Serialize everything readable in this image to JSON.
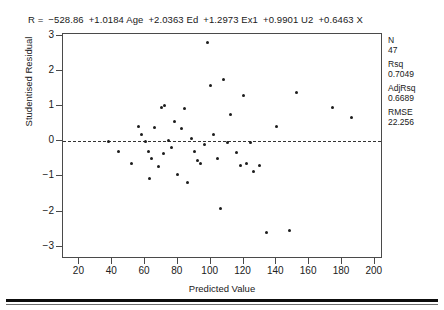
{
  "equation": {
    "lhs": "R  =",
    "terms": [
      "−528.86",
      "+1.0184 Age",
      "+2.0363 Ed",
      "+1.2973 Ex1",
      "+0.9901 U2",
      "+0.6463 X"
    ]
  },
  "stats": [
    {
      "name": "N",
      "value": "47"
    },
    {
      "name": "Rsq",
      "value": "0.7049"
    },
    {
      "name": "AdjRsq",
      "value": "0.6689"
    },
    {
      "name": "RMSE",
      "value": "22.256"
    }
  ],
  "colors": {
    "point": "#1c1c1c",
    "frame": "#4a4a4a",
    "zero_line": "#333333",
    "rule": "#0d0d0d"
  },
  "chart_data": {
    "type": "scatter",
    "title": "",
    "xlabel": "Predicted Value",
    "ylabel": "Studentised Residual",
    "xlim": [
      10,
      205
    ],
    "ylim": [
      -3.35,
      3.05
    ],
    "xticks": [
      20,
      40,
      60,
      80,
      100,
      120,
      140,
      160,
      180,
      200
    ],
    "yticks": [
      3,
      2,
      1,
      0,
      -1,
      -2,
      -3
    ],
    "grid": false,
    "legend": null,
    "reference_line": {
      "orientation": "horizontal",
      "y": 0,
      "style": "dashed"
    },
    "x": [
      38,
      44,
      52,
      56,
      58,
      60,
      62,
      63,
      64,
      66,
      68,
      70,
      71,
      72,
      74,
      76,
      78,
      80,
      82,
      84,
      86,
      88,
      90,
      92,
      94,
      96,
      98,
      100,
      102,
      104,
      106,
      108,
      110,
      112,
      116,
      118,
      120,
      122,
      124,
      126,
      130,
      134,
      140,
      148,
      152,
      174,
      186
    ],
    "y": [
      -0.02,
      -0.28,
      -0.62,
      0.42,
      0.18,
      -0.02,
      -0.3,
      -1.05,
      -0.5,
      0.38,
      -0.72,
      0.95,
      -0.35,
      1.02,
      0.02,
      -0.18,
      0.55,
      -0.95,
      0.35,
      0.92,
      -1.18,
      0.08,
      -0.3,
      -0.55,
      -0.62,
      -0.08,
      2.8,
      1.58,
      0.2,
      -0.48,
      -1.92,
      1.75,
      -0.05,
      0.75,
      -0.32,
      -0.7,
      1.3,
      -0.62,
      -0.05,
      -0.85,
      -0.7,
      -2.6,
      0.42,
      -2.55,
      1.4,
      0.95,
      0.68
    ]
  }
}
